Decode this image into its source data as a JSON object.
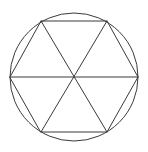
{
  "figure": {
    "title": "Circle with inscribed regular hexagon and three main diagonals",
    "background_color": "#ffffff",
    "stroke_color": "#3a3a3a",
    "stroke_width": 1,
    "canvas": {
      "width": 148,
      "height": 152
    },
    "circle": {
      "name": "circumscribed-circle",
      "center_x": 74,
      "center_y": 77,
      "radius": 64
    },
    "hexagon": {
      "name": "inscribed-regular-hexagon",
      "sides": 6,
      "points": "10,77 41,21 107,21 138,77 107,132 41,132",
      "vertices": [
        {
          "label": "left",
          "x": 10,
          "y": 77
        },
        {
          "label": "top-left",
          "x": 41,
          "y": 21
        },
        {
          "label": "top-right",
          "x": 107,
          "y": 21
        },
        {
          "label": "right",
          "x": 138,
          "y": 77
        },
        {
          "label": "bottom-right",
          "x": 107,
          "y": 132
        },
        {
          "label": "bottom-left",
          "x": 41,
          "y": 132
        }
      ]
    },
    "diagonals": [
      {
        "label": "horizontal-diameter",
        "x1": 10,
        "y1": 77,
        "x2": 138,
        "y2": 77
      },
      {
        "label": "top-left-to-bottom-right",
        "x1": 41,
        "y1": 21,
        "x2": 107,
        "y2": 132
      },
      {
        "label": "top-right-to-bottom-left",
        "x1": 107,
        "y1": 21,
        "x2": 41,
        "y2": 132
      }
    ],
    "center_point": {
      "label": "center",
      "x": 74,
      "y": 77
    },
    "triangle_count": 6
  }
}
